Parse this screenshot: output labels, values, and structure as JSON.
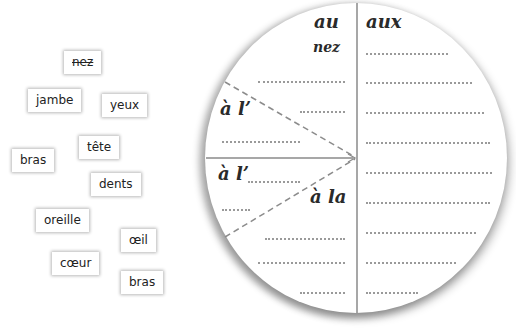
{
  "word_bank": {
    "items": [
      {
        "label": "nez",
        "x": 64,
        "y": 51,
        "struck": true
      },
      {
        "label": "jambe",
        "x": 28,
        "y": 89,
        "struck": false
      },
      {
        "label": "yeux",
        "x": 102,
        "y": 94,
        "struck": false
      },
      {
        "label": "tête",
        "x": 79,
        "y": 136,
        "struck": false
      },
      {
        "label": "bras",
        "x": 12,
        "y": 149,
        "struck": false
      },
      {
        "label": "dents",
        "x": 91,
        "y": 173,
        "struck": false
      },
      {
        "label": "oreille",
        "x": 36,
        "y": 209,
        "struck": false
      },
      {
        "label": "œil",
        "x": 121,
        "y": 229,
        "struck": false
      },
      {
        "label": "cœur",
        "x": 52,
        "y": 252,
        "struck": false
      },
      {
        "label": "bras",
        "x": 121,
        "y": 271,
        "struck": false
      }
    ]
  },
  "disc": {
    "headers": {
      "au": "au",
      "aux": "aux"
    },
    "sections": {
      "a_l_upper": "à l’",
      "a_l_lower": "à l’",
      "a_la": "à la"
    },
    "filled_answers": {
      "au_first": "nez"
    }
  },
  "colors": {
    "divider": "#8a8a8a",
    "dashed": "#8c8c8c",
    "dotted": "#9a9a9a",
    "text": "#2a2a2a"
  }
}
